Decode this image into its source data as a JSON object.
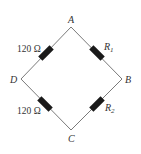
{
  "diagram": {
    "nodes": [
      {
        "id": "A",
        "label": "A"
      },
      {
        "id": "B",
        "label": "B"
      },
      {
        "id": "C",
        "label": "C"
      },
      {
        "id": "D",
        "label": "D"
      }
    ],
    "resistors": [
      {
        "id": "AD",
        "from": "A",
        "to": "D",
        "label": "120 Ω"
      },
      {
        "id": "AB",
        "from": "A",
        "to": "B",
        "label_main": "R",
        "label_sub": "1"
      },
      {
        "id": "DC",
        "from": "D",
        "to": "C",
        "label": "120 Ω"
      },
      {
        "id": "BC",
        "from": "B",
        "to": "C",
        "label_main": "R",
        "label_sub": "2"
      }
    ],
    "colors": {
      "wire": "#7a7a7a",
      "resistor": "#1a1a1a",
      "text": "#333333"
    }
  }
}
